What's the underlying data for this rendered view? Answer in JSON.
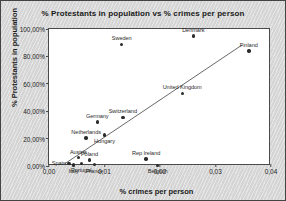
{
  "chart_data": {
    "type": "scatter",
    "title": "% Protestants in population vs % crimes per person",
    "xlabel": "% crimes per person",
    "ylabel": "% Protestants in population",
    "xlim": [
      0.0,
      0.04
    ],
    "ylim": [
      0.0,
      1.0
    ],
    "grid": false,
    "legend": "none",
    "xticks": [
      "0,00",
      "0,01",
      "0,02",
      "0,03",
      "0,04"
    ],
    "xtick_values": [
      0.0,
      0.01,
      0.02,
      0.03,
      0.04
    ],
    "yticks": [
      "0,00%",
      "20,00%",
      "40,00%",
      "60,00%",
      "80,00%",
      "100,00%"
    ],
    "ytick_values": [
      0.0,
      0.2,
      0.4,
      0.6,
      0.8,
      1.0
    ],
    "points": [
      {
        "name": "Denmark",
        "x": 0.026,
        "y": 0.95,
        "label_pos": "above"
      },
      {
        "name": "Finland",
        "x": 0.036,
        "y": 0.84,
        "label_pos": "above"
      },
      {
        "name": "Sweden",
        "x": 0.0131,
        "y": 0.888,
        "label_pos": "above"
      },
      {
        "name": "United Kingdom",
        "x": 0.024,
        "y": 0.53,
        "label_pos": "above"
      },
      {
        "name": "Switzerland",
        "x": 0.0133,
        "y": 0.355,
        "label_pos": "above"
      },
      {
        "name": "Germany",
        "x": 0.0087,
        "y": 0.32,
        "label_pos": "above"
      },
      {
        "name": "Hungary",
        "x": 0.01,
        "y": 0.225,
        "label_pos": "below"
      },
      {
        "name": "Netherlands",
        "x": 0.0067,
        "y": 0.205,
        "label_pos": "above"
      },
      {
        "name": "Rep Ireland",
        "x": 0.0175,
        "y": 0.05,
        "label_pos": "above"
      },
      {
        "name": "Belgium",
        "x": 0.0196,
        "y": 0.005,
        "label_pos": "below"
      },
      {
        "name": "Austria",
        "x": 0.0053,
        "y": 0.06,
        "label_pos": "above"
      },
      {
        "name": "Poland",
        "x": 0.0073,
        "y": 0.045,
        "label_pos": "above"
      },
      {
        "name": "Spain",
        "x": 0.0036,
        "y": 0.02,
        "label_pos": "left"
      },
      {
        "name": "Portugal",
        "x": 0.0058,
        "y": 0.018,
        "label_pos": "below"
      },
      {
        "name": "Italy",
        "x": 0.0044,
        "y": 0.008,
        "label_pos": "below"
      },
      {
        "name": "France",
        "x": 0.0082,
        "y": 0.01,
        "label_pos": "below"
      }
    ],
    "trendline": {
      "x_start": 0.0026,
      "y_start": 0.0,
      "x_end": 0.0352,
      "y_end": 0.885
    }
  }
}
